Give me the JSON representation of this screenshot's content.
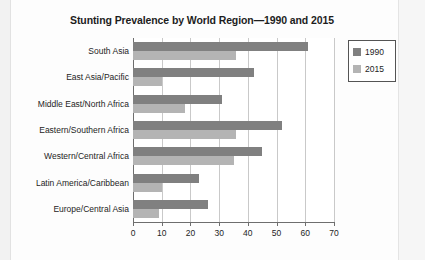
{
  "chart_data": {
    "type": "bar",
    "orientation": "horizontal",
    "title": "Stunting Prevalence by World Region—1990 and 2015",
    "xlabel": "",
    "ylabel": "",
    "xlim": [
      0,
      70
    ],
    "xticks": [
      0,
      10,
      20,
      30,
      40,
      50,
      60,
      70
    ],
    "grid": true,
    "legend_position": "top-right",
    "categories": [
      "South Asia",
      "East Asia/Pacific",
      "Middle East/North Africa",
      "Eastern/Southern Africa",
      "Western/Central Africa",
      "Latin America/Caribbean",
      "Europe/Central Asia"
    ],
    "series": [
      {
        "name": "1990",
        "color": "#808080",
        "values": [
          61,
          42,
          31,
          52,
          45,
          23,
          26
        ]
      },
      {
        "name": "2015",
        "color": "#b4b4b4",
        "values": [
          36,
          10,
          18,
          36,
          35,
          10,
          9
        ]
      }
    ]
  },
  "legend": {
    "items": [
      {
        "label": "1990",
        "color": "#808080"
      },
      {
        "label": "2015",
        "color": "#b4b4b4"
      }
    ]
  }
}
